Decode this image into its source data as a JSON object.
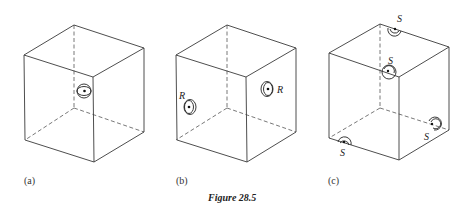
{
  "figure": {
    "caption": "Figure 28.5",
    "panels": [
      {
        "id": "a",
        "label": "(a)",
        "description": "Cube with a rotation-axis symbol at the centre of the front-left vertical edge",
        "symbols": [
          {
            "type": "double-circle-with-dot",
            "label": ""
          }
        ]
      },
      {
        "id": "b",
        "label": "(b)",
        "description": "Cube with axis symbols at the centres of two faces",
        "symbols": [
          {
            "type": "circle-with-dot",
            "label": "R",
            "position": "left face"
          },
          {
            "type": "circle-with-dot",
            "label": "R",
            "position": "right face"
          }
        ]
      },
      {
        "id": "c",
        "label": "(c)",
        "description": "Cube with half-circle symbols at the midpoints of four edges",
        "symbols": [
          {
            "type": "half-circle-with-dot",
            "label": "S",
            "position": "back top edge"
          },
          {
            "type": "half-circle-with-dot",
            "label": "S",
            "position": "front top vertex edge"
          },
          {
            "type": "half-circle-with-dot",
            "label": "S",
            "position": "right bottom edge"
          },
          {
            "type": "half-circle-with-dot",
            "label": "S",
            "position": "left bottom edge"
          }
        ]
      }
    ]
  }
}
